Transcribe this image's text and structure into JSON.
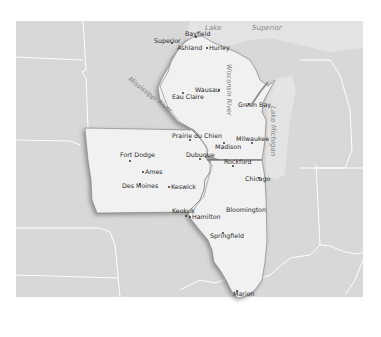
{
  "map": {
    "water_labels": {
      "lake_superior_1": "Lake",
      "lake_superior_2": "Superior",
      "lake_michigan": "Lake Michigan"
    },
    "river_labels": {
      "mississippi": "Mississippi River",
      "wisconsin": "Wisconsin River"
    },
    "cities": {
      "bayfield": "Bayfield",
      "superior": "Superior",
      "ashland": "Ashland",
      "hurley": "Hurley",
      "wausau": "Wausau",
      "eau_claire": "Eau Claire",
      "green_bay": "Green Bay",
      "prairie_du_chien": "Prairie du Chien",
      "milwaukee": "Milwaukee",
      "madison": "Madison",
      "dubuque": "Dubuque",
      "rockford": "Rockford",
      "fort_dodge": "Fort Dodge",
      "ames": "Ames",
      "des_moines": "Des Moines",
      "keswick": "Keswick",
      "chicago": "Chicago",
      "keokuk": "Keokuk",
      "hamilton": "Hamilton",
      "bloomington": "Bloomington",
      "springfield": "Springfield",
      "marion": "Marion"
    },
    "colors": {
      "background": "#ffffff",
      "land_other": "#d9d9d9",
      "water": "#e6e6e6",
      "highlight_states": "#f2f2f2",
      "border": "#ffffff",
      "state_outline": "#6e6e6e"
    }
  }
}
